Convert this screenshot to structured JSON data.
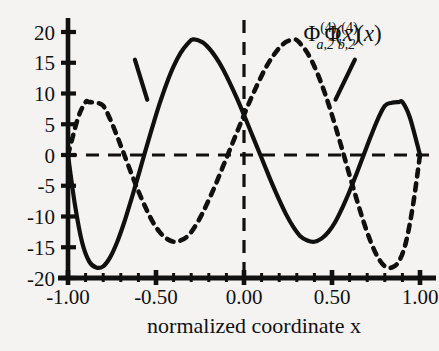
{
  "chart_data": {
    "type": "line",
    "title": "",
    "subtitle": "",
    "xlabel": "normalized coordinate x",
    "ylabel": "",
    "xlim": [
      -1.0,
      1.0
    ],
    "ylim": [
      -20,
      20
    ],
    "grid": false,
    "legend_position": "inline-annotations",
    "x_ticks": [
      -1.0,
      -0.5,
      0.0,
      0.5,
      1.0
    ],
    "x_tick_labels": [
      "-1.00",
      "-0.50",
      "0.00",
      "0.50",
      "1.00"
    ],
    "x_minor_ticks": [
      -0.9,
      -0.8,
      -0.7,
      -0.6,
      -0.4,
      -0.3,
      -0.2,
      -0.1,
      0.1,
      0.2,
      0.3,
      0.4,
      0.6,
      0.7,
      0.8,
      0.9
    ],
    "y_ticks": [
      20,
      15,
      10,
      5,
      0,
      -5,
      -10,
      -15,
      -20
    ],
    "y_tick_labels": [
      "20",
      "15",
      "10",
      "5",
      "0",
      "-5",
      "-10",
      "-15",
      "-20"
    ],
    "zero_line_y": 0,
    "zero_line_x": 0,
    "series": [
      {
        "name": "Phi_a2",
        "label_plain": "Φ(4)a,2(x)",
        "style": "solid",
        "color": "#101010",
        "x": [
          -1.0,
          -0.96,
          -0.92,
          -0.88,
          -0.84,
          -0.8,
          -0.76,
          -0.72,
          -0.68,
          -0.64,
          -0.6,
          -0.56,
          -0.52,
          -0.48,
          -0.44,
          -0.4,
          -0.36,
          -0.32,
          -0.29,
          -0.24,
          -0.2,
          -0.16,
          -0.12,
          -0.08,
          -0.04,
          0.0,
          0.04,
          0.08,
          0.12,
          0.16,
          0.2,
          0.24,
          0.28,
          0.32,
          0.36,
          0.4,
          0.44,
          0.48,
          0.52,
          0.56,
          0.6,
          0.64,
          0.68,
          0.72,
          0.76,
          0.8,
          0.84,
          0.88,
          0.9,
          0.94,
          0.98,
          1.0
        ],
        "y": [
          0.0,
          -8.2,
          -14.2,
          -17.3,
          -18.3,
          -18.1,
          -16.6,
          -14.1,
          -10.9,
          -7.2,
          -3.3,
          0.7,
          4.6,
          8.3,
          11.6,
          14.4,
          16.6,
          18.1,
          18.8,
          18.4,
          17.4,
          15.9,
          14.0,
          11.7,
          9.2,
          6.5,
          3.7,
          0.9,
          -1.9,
          -4.7,
          -7.3,
          -9.7,
          -11.7,
          -13.2,
          -13.9,
          -14.1,
          -13.6,
          -12.5,
          -10.8,
          -8.5,
          -5.9,
          -3.0,
          0.0,
          3.0,
          5.8,
          8.0,
          8.5,
          8.6,
          8.6,
          6.3,
          2.2,
          0.0
        ]
      },
      {
        "name": "Phi_b2",
        "label_plain": "Φ(4)b,2(x)",
        "style": "dashed",
        "color": "#101010",
        "x": [
          -1.0,
          -0.98,
          -0.94,
          -0.9,
          -0.88,
          -0.84,
          -0.8,
          -0.76,
          -0.72,
          -0.68,
          -0.64,
          -0.6,
          -0.56,
          -0.52,
          -0.48,
          -0.44,
          -0.4,
          -0.36,
          -0.32,
          -0.28,
          -0.24,
          -0.2,
          -0.16,
          -0.12,
          -0.08,
          -0.04,
          0.0,
          0.04,
          0.08,
          0.12,
          0.16,
          0.2,
          0.24,
          0.29,
          0.32,
          0.36,
          0.4,
          0.44,
          0.48,
          0.52,
          0.56,
          0.6,
          0.64,
          0.68,
          0.72,
          0.76,
          0.8,
          0.84,
          0.88,
          0.92,
          0.96,
          1.0
        ],
        "y": [
          0.0,
          2.2,
          6.3,
          8.6,
          8.6,
          8.5,
          8.0,
          5.8,
          3.0,
          0.0,
          -3.0,
          -5.9,
          -8.5,
          -10.8,
          -12.5,
          -13.6,
          -14.1,
          -13.9,
          -13.2,
          -11.7,
          -9.7,
          -7.3,
          -4.7,
          -1.9,
          0.9,
          3.7,
          6.5,
          9.2,
          11.7,
          14.0,
          15.9,
          17.4,
          18.4,
          18.8,
          18.1,
          16.6,
          14.4,
          11.6,
          8.3,
          4.6,
          0.7,
          -3.3,
          -7.2,
          -10.9,
          -14.1,
          -16.6,
          -18.1,
          -18.3,
          -17.3,
          -14.2,
          -8.2,
          0.0
        ]
      }
    ],
    "annotations": [
      {
        "name": "label-phi-a2",
        "phi": "Φ",
        "superscript": "(4)",
        "subscript": "a,2",
        "argument": "(x)",
        "x_text": 0.5,
        "y_text": 18.5,
        "leader_from": [
          -0.62,
          15.5
        ],
        "leader_to": [
          -0.55,
          9.0
        ]
      },
      {
        "name": "label-phi-b2",
        "phi": "Φ",
        "superscript": "(4)",
        "subscript": "b,2",
        "argument": "(x)",
        "x_text": 0.62,
        "y_text": 18.5,
        "leader_from": [
          0.63,
          15.5
        ],
        "leader_to": [
          0.52,
          9.0
        ]
      }
    ]
  },
  "axis": {
    "x_title": "normalized coordinate x",
    "y_tick_labels": [
      "20",
      "15",
      "10",
      "5",
      "0",
      "-5",
      "-10",
      "-15",
      "-20"
    ],
    "x_tick_labels": [
      "-1.00",
      "-0.50",
      "0.00",
      "0.50",
      "1.00"
    ]
  },
  "colors": {
    "background": "#f4f3f1",
    "ink": "#101010",
    "curve_solid": "#101010",
    "curve_dashed": "#101010"
  }
}
